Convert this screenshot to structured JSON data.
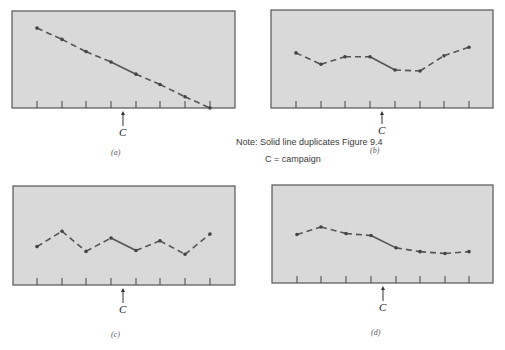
{
  "note": {
    "line1": "Note: Solid line duplicates Figure 9.4",
    "line2": "C = campaign"
  },
  "campaign_label": "C",
  "colors": {
    "panel_bg": "#d9d9d9",
    "panel_border": "#555555",
    "line": "#555555",
    "point": "#444444"
  },
  "chart_data": [
    {
      "type": "line",
      "title": "",
      "caption": "(a)",
      "x": [
        1,
        2,
        3,
        4,
        5,
        6,
        7,
        8
      ],
      "series": [
        {
          "name": "sales",
          "values": [
            85,
            73,
            60,
            49,
            36,
            25,
            12,
            0
          ]
        }
      ],
      "solid_segment": [
        4,
        5
      ],
      "campaign_between": [
        4,
        5
      ],
      "annotation": "C",
      "xlabel": "",
      "ylabel": "",
      "ylim": [
        0,
        100
      ],
      "grid": false
    },
    {
      "type": "line",
      "title": "",
      "caption": "(b)",
      "x": [
        1,
        2,
        3,
        4,
        5,
        6,
        7,
        8
      ],
      "series": [
        {
          "name": "sales",
          "values": [
            58,
            46,
            54,
            54,
            40,
            39,
            55,
            64
          ]
        }
      ],
      "solid_segment": [
        4,
        5
      ],
      "campaign_between": [
        4,
        5
      ],
      "annotation": "C",
      "xlabel": "",
      "ylabel": "",
      "ylim": [
        0,
        100
      ],
      "grid": false
    },
    {
      "type": "line",
      "title": "",
      "caption": "(c)",
      "x": [
        1,
        2,
        3,
        4,
        5,
        6,
        7,
        8
      ],
      "series": [
        {
          "name": "sales",
          "values": [
            40,
            56,
            35,
            49,
            36,
            46,
            32,
            53
          ]
        }
      ],
      "solid_segment": [
        4,
        5
      ],
      "campaign_between": [
        4,
        5
      ],
      "annotation": "C",
      "xlabel": "",
      "ylabel": "",
      "ylim": [
        0,
        100
      ],
      "grid": false
    },
    {
      "type": "line",
      "title": "",
      "caption": "(d)",
      "x": [
        1,
        2,
        3,
        4,
        5,
        6,
        7,
        8
      ],
      "series": [
        {
          "name": "sales",
          "values": [
            51,
            59,
            52,
            50,
            37,
            33,
            31,
            33
          ]
        }
      ],
      "solid_segment": [
        4,
        5
      ],
      "campaign_between": [
        4,
        5
      ],
      "annotation": "C",
      "xlabel": "",
      "ylabel": "",
      "ylim": [
        0,
        100
      ],
      "grid": false
    }
  ]
}
